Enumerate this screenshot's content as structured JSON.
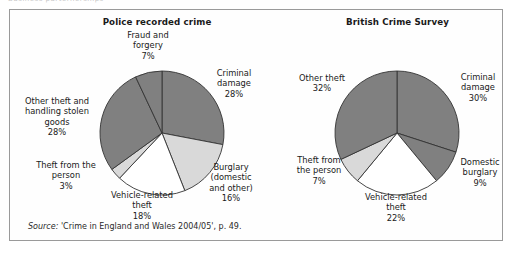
{
  "page": {
    "cut_off_text": "Business parternerships",
    "source_note_prefix": "Source:",
    "source_note": " 'Crime in England and Wales 2004/05', p. 49."
  },
  "colors": {
    "dark_gray": "#808080",
    "light_gray": "#d9d9d9",
    "white": "#ffffff",
    "outline": "#333333",
    "panel_border": "#9a9a9a",
    "text": "#1a1a1a"
  },
  "chart_data": [
    {
      "type": "pie",
      "title": "Police recorded crime",
      "labels": [
        "Criminal damage",
        "Burglary (domestic and other)",
        "Vehicle-related theft",
        "Theft from the person",
        "Other theft and handling stolen goods",
        "Fraud and forgery"
      ],
      "values": [
        28,
        16,
        18,
        3,
        28,
        7
      ],
      "value_labels": [
        "28%",
        "16%",
        "18%",
        "3%",
        "28%",
        "7%"
      ],
      "slice_colors": [
        "#808080",
        "#d9d9d9",
        "#ffffff",
        "#d9d9d9",
        "#808080",
        "#808080"
      ],
      "start_angle_deg": 0,
      "direction": "clockwise",
      "units": "percent",
      "callouts": [
        {
          "id": "fraud",
          "text": "Fraud and\nforgery\n7%"
        },
        {
          "id": "criminal",
          "text": "Criminal\ndamage\n28%"
        },
        {
          "id": "burglary",
          "text": "Burglary\n(domestic\nand other)\n16%"
        },
        {
          "id": "vehicle",
          "text": "Vehicle-related\ntheft\n18%"
        },
        {
          "id": "person",
          "text": "Theft from the\nperson\n3%"
        },
        {
          "id": "other",
          "text": "Other theft and\nhandling stolen\ngoods\n28%"
        }
      ]
    },
    {
      "type": "pie",
      "title": "British Crime Survey",
      "labels": [
        "Criminal damage",
        "Domestic burglary",
        "Vehicle-related theft",
        "Theft from the person",
        "Other theft"
      ],
      "values": [
        30,
        9,
        22,
        7,
        32
      ],
      "value_labels": [
        "30%",
        "9%",
        "22%",
        "7%",
        "32%"
      ],
      "slice_colors": [
        "#808080",
        "#808080",
        "#ffffff",
        "#d9d9d9",
        "#808080"
      ],
      "start_angle_deg": 0,
      "direction": "clockwise",
      "units": "percent",
      "callouts": [
        {
          "id": "criminal",
          "text": "Criminal\ndamage\n30%"
        },
        {
          "id": "domestic",
          "text": "Domestic\nburglary\n9%"
        },
        {
          "id": "vehicle",
          "text": "Vehicle-related\ntheft\n22%"
        },
        {
          "id": "person",
          "text": "Theft from\nthe person\n7%"
        },
        {
          "id": "other",
          "text": "Other theft\n32%"
        }
      ]
    }
  ]
}
